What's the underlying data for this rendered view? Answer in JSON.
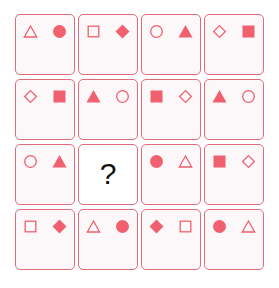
{
  "puzzle": {
    "colors": {
      "shape": "#f0606e",
      "border": "#e46b7a",
      "cell_bg": "#fcf7f8",
      "question_bg": "#ffffff",
      "question_text": "#111111"
    },
    "question_label": "?",
    "grid": [
      [
        {
          "left": {
            "shape": "triangle",
            "style": "outline"
          },
          "right": {
            "shape": "circle",
            "style": "filled"
          }
        },
        {
          "left": {
            "shape": "square",
            "style": "outline"
          },
          "right": {
            "shape": "diamond",
            "style": "filled"
          }
        },
        {
          "left": {
            "shape": "circle",
            "style": "outline"
          },
          "right": {
            "shape": "triangle",
            "style": "filled"
          }
        },
        {
          "left": {
            "shape": "diamond",
            "style": "outline"
          },
          "right": {
            "shape": "square",
            "style": "filled"
          }
        }
      ],
      [
        {
          "left": {
            "shape": "diamond",
            "style": "outline"
          },
          "right": {
            "shape": "square",
            "style": "filled"
          }
        },
        {
          "left": {
            "shape": "triangle",
            "style": "filled"
          },
          "right": {
            "shape": "circle",
            "style": "outline"
          }
        },
        {
          "left": {
            "shape": "square",
            "style": "filled"
          },
          "right": {
            "shape": "diamond",
            "style": "outline"
          }
        },
        {
          "left": {
            "shape": "triangle",
            "style": "filled"
          },
          "right": {
            "shape": "circle",
            "style": "outline"
          }
        }
      ],
      [
        {
          "left": {
            "shape": "circle",
            "style": "outline"
          },
          "right": {
            "shape": "triangle",
            "style": "filled"
          }
        },
        {
          "question": true
        },
        {
          "left": {
            "shape": "circle",
            "style": "filled"
          },
          "right": {
            "shape": "triangle",
            "style": "outline"
          }
        },
        {
          "left": {
            "shape": "square",
            "style": "filled"
          },
          "right": {
            "shape": "diamond",
            "style": "outline"
          }
        }
      ],
      [
        {
          "left": {
            "shape": "square",
            "style": "outline"
          },
          "right": {
            "shape": "diamond",
            "style": "filled"
          }
        },
        {
          "left": {
            "shape": "triangle",
            "style": "outline"
          },
          "right": {
            "shape": "circle",
            "style": "filled"
          }
        },
        {
          "left": {
            "shape": "diamond",
            "style": "filled"
          },
          "right": {
            "shape": "square",
            "style": "outline"
          }
        },
        {
          "left": {
            "shape": "circle",
            "style": "filled"
          },
          "right": {
            "shape": "triangle",
            "style": "outline"
          }
        }
      ]
    ]
  }
}
